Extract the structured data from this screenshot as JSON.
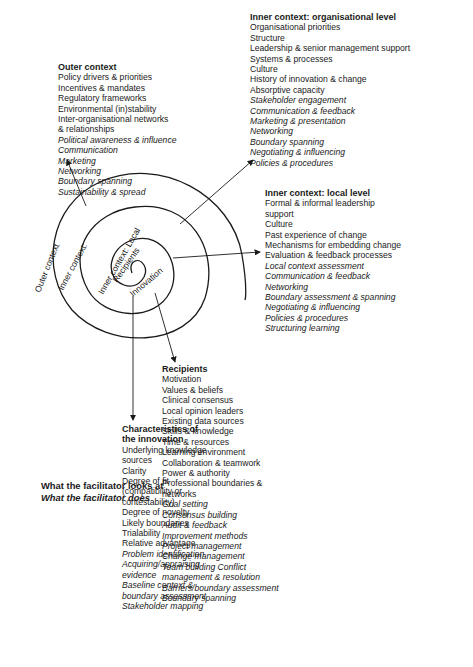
{
  "legend": {
    "title": "What the facilitator looks at",
    "subtitle": "What the facilitator does"
  },
  "spiral_labels": {
    "outer": "Outer context",
    "inner": "Inner context:",
    "local": "Inner context: Local",
    "recipients": "Recipients",
    "innovation": "Innovation"
  },
  "innovation": {
    "heading_line1": "Characteristics of",
    "heading_line2": "the innovation",
    "items": [
      {
        "text": "Underlying knowledge",
        "italic": false
      },
      {
        "text": "sources",
        "italic": false
      },
      {
        "text": "Clarity",
        "italic": false
      },
      {
        "text": "Degree of fit",
        "italic": false
      },
      {
        "text": "(compatibility or",
        "italic": false
      },
      {
        "text": "contestability)",
        "italic": false
      },
      {
        "text": "Degree of novelty",
        "italic": false
      },
      {
        "text": "Likely boundaries",
        "italic": false
      },
      {
        "text": "Trialability",
        "italic": false
      },
      {
        "text": "Relative advantage",
        "italic": false
      },
      {
        "text": "Problem identification",
        "italic": true
      },
      {
        "text": "Acquiring/appraising",
        "italic": true
      },
      {
        "text": "evidence",
        "italic": true
      },
      {
        "text": "Baseline context &",
        "italic": true
      },
      {
        "text": "boundary assessment",
        "italic": true
      },
      {
        "text": "Stakeholder mapping",
        "italic": true
      }
    ]
  },
  "recipients": {
    "heading": "Recipients",
    "items": [
      {
        "text": "Motivation",
        "italic": false
      },
      {
        "text": "Values & beliefs",
        "italic": false
      },
      {
        "text": "Clinical  consensus",
        "italic": false
      },
      {
        "text": "Local opinion leaders",
        "italic": false
      },
      {
        "text": "Existing data sources",
        "italic": false
      },
      {
        "text": "Skills & knowledge",
        "italic": false
      },
      {
        "text": "Time & resources",
        "italic": false
      },
      {
        "text": "Learning environment",
        "italic": false
      },
      {
        "text": "Collaboration & teamwork",
        "italic": false
      },
      {
        "text": "Power & authority",
        "italic": false
      },
      {
        "text": "Professional boundaries &",
        "italic": false
      },
      {
        "text": "networks",
        "italic": false
      },
      {
        "text": "Goal setting",
        "italic": true
      },
      {
        "text": "Consensus building",
        "italic": true
      },
      {
        "text": "Audit & feedback",
        "italic": true
      },
      {
        "text": "Improvement methods",
        "italic": true
      },
      {
        "text": "Project management",
        "italic": true
      },
      {
        "text": "Change management",
        "italic": true
      },
      {
        "text": "Team building Conflict",
        "italic": true
      },
      {
        "text": "management & resolution",
        "italic": true
      },
      {
        "text": "Barriers/boundary assessment",
        "italic": true
      },
      {
        "text": "Boundary spanning",
        "italic": true
      }
    ]
  },
  "local": {
    "heading": "Inner context: local level",
    "items": [
      {
        "text": "Formal & informal leadership",
        "italic": false
      },
      {
        "text": "support",
        "italic": false
      },
      {
        "text": "Culture",
        "italic": false
      },
      {
        "text": "Past experience of change",
        "italic": false
      },
      {
        "text": "Mechanisms for embedding change",
        "italic": false
      },
      {
        "text": "Evaluation & feedback processes",
        "italic": false
      },
      {
        "text": "Local context assessment",
        "italic": true
      },
      {
        "text": "Communication & feedback",
        "italic": true
      },
      {
        "text": "Networking",
        "italic": true
      },
      {
        "text": "Boundary  assessment & spanning",
        "italic": true
      },
      {
        "text": "Negotiating & influencing",
        "italic": true
      },
      {
        "text": "Policies &  procedures",
        "italic": true
      },
      {
        "text": "Structuring learning",
        "italic": true
      }
    ]
  },
  "organisational": {
    "heading": "Inner context: organisational level",
    "items": [
      {
        "text": "Organisational priorities",
        "italic": false
      },
      {
        "text": "Structure",
        "italic": false
      },
      {
        "text": "Leadership & senior management support",
        "italic": false
      },
      {
        "text": "Systems & processes",
        "italic": false
      },
      {
        "text": "Culture",
        "italic": false
      },
      {
        "text": "History of innovation & change",
        "italic": false
      },
      {
        "text": "Absorptive capacity",
        "italic": false
      },
      {
        "text": "Stakeholder engagement",
        "italic": true
      },
      {
        "text": "Communication & feedback",
        "italic": true
      },
      {
        "text": "Marketing & presentation",
        "italic": true
      },
      {
        "text": "Networking",
        "italic": true
      },
      {
        "text": "Boundary spanning",
        "italic": true
      },
      {
        "text": "Negotiating & influencing",
        "italic": true
      },
      {
        "text": "Policies & procedures",
        "italic": true
      }
    ]
  },
  "outer": {
    "heading": "Outer context",
    "items": [
      {
        "text": "Policy drivers & priorities",
        "italic": false
      },
      {
        "text": "Incentives & mandates",
        "italic": false
      },
      {
        "text": "Regulatory frameworks",
        "italic": false
      },
      {
        "text": "Environmental (in)stability",
        "italic": false
      },
      {
        "text": "Inter-organisational networks",
        "italic": false
      },
      {
        "text": "& relationships",
        "italic": false
      },
      {
        "text": "Political awareness & influence",
        "italic": true
      },
      {
        "text": "Communication",
        "italic": true
      },
      {
        "text": "Marketing",
        "italic": true
      },
      {
        "text": "Networking",
        "italic": true
      },
      {
        "text": "Boundary spanning",
        "italic": true
      },
      {
        "text": "Sustainability & spread",
        "italic": true
      }
    ]
  }
}
